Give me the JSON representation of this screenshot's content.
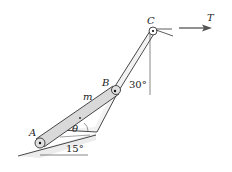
{
  "diagram": {
    "type": "mechanics-linkage",
    "points": {
      "A": {
        "label": "A"
      },
      "B": {
        "label": "B"
      },
      "C": {
        "label": "C"
      }
    },
    "labels": {
      "mass": "m",
      "theta": "θ",
      "angle_incline": "15°",
      "angle_vertical": "30°",
      "force": "T"
    },
    "colors": {
      "rod_fill": "#d9d9d9",
      "line": "#333333",
      "shadow": "#e6e6e6"
    }
  }
}
